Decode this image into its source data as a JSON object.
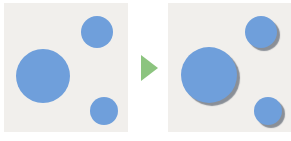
{
  "colors": {
    "background": "#ffffff",
    "panel": "#f1efec",
    "circle": "#6f9fdb",
    "shadow": "#8a8f97",
    "arrow": "#8cc47f"
  },
  "panels": [
    {
      "name": "before-panel",
      "x": 4,
      "y": 3,
      "w": 124,
      "h": 129,
      "shadow": false,
      "circles": [
        {
          "name": "large-circle",
          "cx": 43,
          "cy": 76,
          "r": 27
        },
        {
          "name": "top-small-circle",
          "cx": 97,
          "cy": 32,
          "r": 16
        },
        {
          "name": "bottom-small-circle",
          "cx": 104,
          "cy": 111,
          "r": 14
        }
      ]
    },
    {
      "name": "after-panel",
      "x": 168,
      "y": 3,
      "w": 123,
      "h": 129,
      "shadow": true,
      "circles": [
        {
          "name": "large-circle-shadowed",
          "cx": 209,
          "cy": 75,
          "r": 28
        },
        {
          "name": "top-small-circle-shadowed",
          "cx": 261,
          "cy": 32,
          "r": 16
        },
        {
          "name": "bottom-small-circle-shadowed",
          "cx": 268,
          "cy": 111,
          "r": 14
        }
      ]
    }
  ],
  "arrow": {
    "name": "transition-arrow",
    "x": 141,
    "y": 55,
    "w": 17,
    "h": 26
  }
}
